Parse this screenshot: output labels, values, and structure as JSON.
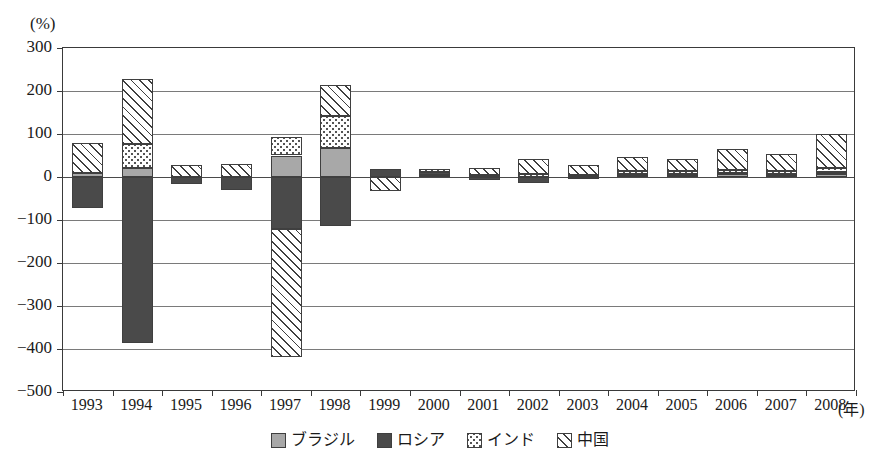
{
  "chart_data": {
    "type": "bar",
    "subtype": "stacked-bar-with-negatives",
    "title": "",
    "subtitle": "",
    "xlabel": "(年)",
    "ylabel": "(%)",
    "unit_label": "(%)",
    "xaxis_unit": "(年)",
    "ylim": [
      -500,
      300
    ],
    "yticks": [
      300,
      200,
      100,
      0,
      -100,
      -200,
      -300,
      -400,
      -500
    ],
    "ytick_labels": [
      "300",
      "200",
      "100",
      "0",
      "−100",
      "−200",
      "−300",
      "−400",
      "−500"
    ],
    "grid": true,
    "grid_orientation": "horizontal",
    "legend_position": "bottom-center",
    "categories": [
      "1993",
      "1994",
      "1995",
      "1996",
      "1997",
      "1998",
      "1999",
      "2000",
      "2001",
      "2002",
      "2003",
      "2004",
      "2005",
      "2006",
      "2007",
      "2008"
    ],
    "series": [
      {
        "name": "ブラジル",
        "key": "brazil",
        "color": "#a8a8a8",
        "pattern": "solid-light-gray",
        "values": [
          10,
          21,
          0,
          0,
          50,
          68,
          0,
          4,
          0,
          0,
          0,
          6,
          4,
          6,
          5,
          8
        ]
      },
      {
        "name": "ロシア",
        "key": "russia",
        "color": "#4a4a4a",
        "pattern": "solid-dark-gray",
        "values": [
          -72,
          -385,
          -17,
          -31,
          -122,
          -115,
          18,
          8,
          -7,
          -14,
          -4,
          2,
          2,
          3,
          2,
          4
        ]
      },
      {
        "name": "インド",
        "key": "india",
        "color": "#ffffff",
        "pattern": "dotted",
        "values": [
          0,
          56,
          0,
          0,
          43,
          74,
          0,
          7,
          4,
          6,
          4,
          5,
          8,
          7,
          6,
          9
        ]
      },
      {
        "name": "中国",
        "key": "china",
        "color": "#ffffff",
        "pattern": "diagonal-hatch",
        "values": [
          68,
          150,
          27,
          31,
          -296,
          73,
          -33,
          0,
          16,
          37,
          25,
          33,
          29,
          48,
          41,
          79
        ]
      }
    ],
    "stack_totals_positive": [
      78,
      227,
      27,
      31,
      93,
      215,
      18,
      19,
      20,
      43,
      29,
      46,
      43,
      64,
      54,
      100
    ],
    "stack_totals_negative": [
      -72,
      -385,
      -17,
      -31,
      -418,
      -115,
      -33,
      0,
      -7,
      -14,
      -4,
      0,
      0,
      0,
      0,
      0
    ]
  },
  "legend": {
    "items": [
      {
        "label": "ブラジル",
        "swatch": "solid-light-gray"
      },
      {
        "label": "ロシア",
        "swatch": "solid-dark-gray"
      },
      {
        "label": "インド",
        "swatch": "dotted"
      },
      {
        "label": "中国",
        "swatch": "diagonal-hatch"
      }
    ]
  },
  "colors": {
    "brazil": "#a8a8a8",
    "russia": "#4a4a4a",
    "india": "#ffffff",
    "china": "#ffffff",
    "axis": "#3a3a3a",
    "grid": "#7a7a7a",
    "background": "#ffffff"
  }
}
